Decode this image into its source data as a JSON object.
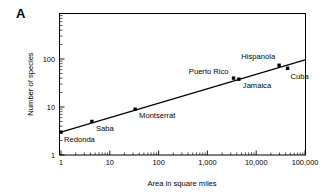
{
  "figure": {
    "panel_label": "A"
  },
  "chart_data": {
    "type": "scatter",
    "title": "",
    "xlabel": "Area in square miles",
    "ylabel": "Number of species",
    "xscale": "log",
    "yscale": "log",
    "xlim": [
      1,
      100000
    ],
    "ylim": [
      1,
      300
    ],
    "grid": false,
    "legend": "none",
    "xticks": [
      1,
      10,
      100,
      1000,
      10000,
      100000
    ],
    "xticklabels": [
      "1",
      "10",
      "100",
      "1,000",
      "10,000",
      "100,000"
    ],
    "yticks": [
      1,
      10,
      100
    ],
    "yticklabels": [
      "1",
      "10",
      "100"
    ],
    "points": [
      {
        "name": "Redonda",
        "x": 1,
        "y": 3,
        "label_dx": 3,
        "label_dy": 10,
        "anchor": "start"
      },
      {
        "name": "Saba",
        "x": 4.3,
        "y": 5,
        "label_dx": 4,
        "label_dy": 10,
        "anchor": "start"
      },
      {
        "name": "Montserrat",
        "x": 33,
        "y": 9,
        "label_dx": 4,
        "label_dy": 9,
        "anchor": "start"
      },
      {
        "name": "Puerto Rico",
        "x": 3435,
        "y": 40,
        "label_dx": -5,
        "label_dy": -4,
        "anchor": "end"
      },
      {
        "name": "Jamaica",
        "x": 4411,
        "y": 38,
        "label_dx": 4,
        "label_dy": 9,
        "anchor": "start"
      },
      {
        "name": "Hispanola",
        "x": 29500,
        "y": 74,
        "label_dx": -4,
        "label_dy": -6,
        "anchor": "end"
      },
      {
        "name": "Cuba",
        "x": 44000,
        "y": 64,
        "label_dx": 3,
        "label_dy": 11,
        "anchor": "start"
      }
    ],
    "fit_line": {
      "x_start": 1,
      "y_start": 3,
      "x_end": 100000,
      "y_end": 96,
      "description": "species-area regression line"
    },
    "annotations": [
      "Redonda",
      "Saba",
      "Montserrat",
      "Puerto Rico",
      "Jamaica",
      "Hispanola",
      "Cuba"
    ]
  },
  "colors": {
    "axis": "#000000",
    "line": "#000000",
    "marker": "#000000",
    "background": "#ffffff"
  }
}
